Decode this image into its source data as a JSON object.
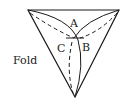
{
  "diagram": {
    "labels": {
      "a": "A",
      "b": "B",
      "c": "C",
      "fold": "Fold"
    },
    "colors": {
      "line": "#1a1a1a",
      "background": "#ffffff"
    }
  }
}
